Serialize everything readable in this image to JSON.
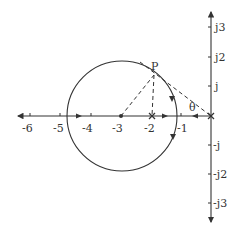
{
  "diagram": {
    "type": "complex-plane root locus / circle diagram",
    "real_axis": {
      "ticks": [
        {
          "label": "-6",
          "x": 30
        },
        {
          "label": "-5",
          "x": 60
        },
        {
          "label": "-4",
          "x": 91
        },
        {
          "label": "-3",
          "x": 121
        },
        {
          "label": "-2",
          "x": 152
        },
        {
          "label": "-1",
          "x": 181
        }
      ]
    },
    "imag_axis": {
      "ticks": [
        {
          "label": "j3",
          "y": 27
        },
        {
          "label": "j2",
          "y": 57
        },
        {
          "label": "j",
          "y": 86
        },
        {
          "label": "-j",
          "y": 145
        },
        {
          "label": "-j2",
          "y": 174
        },
        {
          "label": "-j3",
          "y": 203
        }
      ]
    },
    "point_label": "P",
    "angle_label": "θ",
    "colors": {
      "line": "#333333",
      "background": "#ffffff"
    }
  }
}
